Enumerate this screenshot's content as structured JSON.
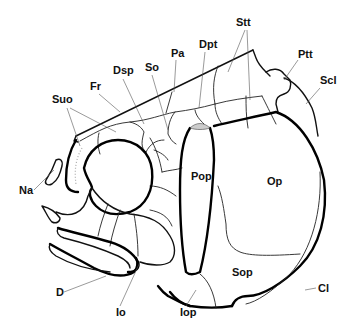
{
  "figure": {
    "type": "anatomical line drawing",
    "labels": [
      {
        "id": "stt",
        "text": "Stt",
        "x": 236,
        "y": 26
      },
      {
        "id": "pa",
        "text": "Pa",
        "x": 171,
        "y": 57
      },
      {
        "id": "dpt",
        "text": "Dpt",
        "x": 199,
        "y": 48
      },
      {
        "id": "ptt",
        "text": "Ptt",
        "x": 298,
        "y": 58
      },
      {
        "id": "scl",
        "text": "Scl",
        "x": 320,
        "y": 84
      },
      {
        "id": "dsp",
        "text": "Dsp",
        "x": 113,
        "y": 74
      },
      {
        "id": "so",
        "text": "So",
        "x": 145,
        "y": 71
      },
      {
        "id": "fr",
        "text": "Fr",
        "x": 90,
        "y": 90
      },
      {
        "id": "suo",
        "text": "Suo",
        "x": 52,
        "y": 103
      },
      {
        "id": "na",
        "text": "Na",
        "x": 19,
        "y": 194
      },
      {
        "id": "pop",
        "text": "Pop",
        "x": 191,
        "y": 180
      },
      {
        "id": "op",
        "text": "Op",
        "x": 267,
        "y": 185
      },
      {
        "id": "sop",
        "text": "Sop",
        "x": 232,
        "y": 276
      },
      {
        "id": "d",
        "text": "D",
        "x": 56,
        "y": 296
      },
      {
        "id": "io",
        "text": "Io",
        "x": 116,
        "y": 316
      },
      {
        "id": "iop",
        "text": "Iop",
        "x": 180,
        "y": 316
      },
      {
        "id": "cl",
        "text": "Cl",
        "x": 318,
        "y": 289
      }
    ]
  }
}
